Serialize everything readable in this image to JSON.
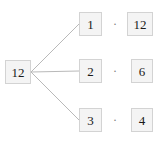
{
  "diagram": {
    "background_color": "#ffffff",
    "node_fill_color": "#f4f4f4",
    "node_border_color": "#d3d3d3",
    "edge_color": "#b9b9b9",
    "text_color": "#1a1a1a",
    "operator_color": "#7a7a7a",
    "root": {
      "label": "12"
    },
    "operator_symbol": "·",
    "rows": [
      {
        "left": "1",
        "operator": "·",
        "right": "12"
      },
      {
        "left": "2",
        "operator": "·",
        "right": "6"
      },
      {
        "left": "3",
        "operator": "·",
        "right": "4"
      }
    ],
    "edges": [
      {
        "from": "12",
        "to": "1"
      },
      {
        "from": "12",
        "to": "2"
      },
      {
        "from": "12",
        "to": "3"
      }
    ]
  }
}
